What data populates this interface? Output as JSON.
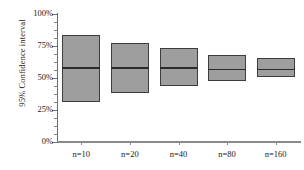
{
  "chart_data": {
    "type": "bar",
    "subtype": "confidence-interval-range-bars",
    "title": "",
    "xlabel": "",
    "ylabel": "95% Confidence interval",
    "categories": [
      "n=10",
      "n=20",
      "n=40",
      "n=80",
      "n=160"
    ],
    "ylim": [
      0,
      100
    ],
    "yunit": "%",
    "ytick_labels": [
      "0%",
      "25%",
      "50%",
      "75%",
      "100%"
    ],
    "ytick_values": [
      0,
      25,
      50,
      75,
      100
    ],
    "minor_ticks_per_interval": 4,
    "grid": false,
    "legend": null,
    "series": [
      {
        "name": "upper bound",
        "values": [
          83,
          77,
          73,
          68,
          65
        ]
      },
      {
        "name": "center estimate",
        "values": [
          58,
          58,
          58,
          57,
          57
        ]
      },
      {
        "name": "lower bound",
        "values": [
          31,
          38,
          43,
          47,
          50
        ]
      }
    ],
    "points": [
      {
        "category": "n=10",
        "lower": 31,
        "center": 58,
        "upper": 83
      },
      {
        "category": "n=20",
        "lower": 38,
        "center": 58,
        "upper": 77
      },
      {
        "category": "n=40",
        "lower": 43,
        "center": 58,
        "upper": 73
      },
      {
        "category": "n=80",
        "lower": 47,
        "center": 57,
        "upper": 68
      },
      {
        "category": "n=160",
        "lower": 50,
        "center": 57,
        "upper": 65
      }
    ],
    "colors": {
      "box_fill": "#9e9e9e",
      "box_border": "#3d3d3d",
      "median_line": "#2b2b2b",
      "axis": "#6e6e6e",
      "text": "#1a1a1a",
      "background": "#ffffff"
    }
  },
  "axes": {
    "y_tick_0": "0%",
    "y_tick_1": "25%",
    "y_tick_2": "50%",
    "y_tick_3": "75%",
    "y_tick_4": "100%",
    "x_tick_0": "n=10",
    "x_tick_1": "n=20",
    "x_tick_2": "n=40",
    "x_tick_3": "n=80",
    "x_tick_4": "n=160"
  }
}
